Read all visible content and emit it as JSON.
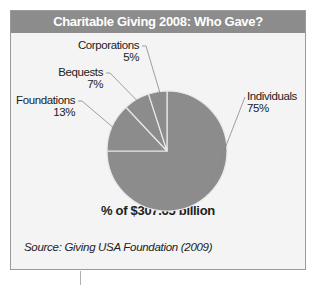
{
  "chart_data": {
    "type": "pie",
    "title": "Charitable Giving 2008: Who Gave?",
    "caption": "% of $307.65 billion",
    "source": "Source: Giving USA Foundation (2009)",
    "slices": [
      {
        "label": "Individuals",
        "value": 75,
        "value_label": "75%"
      },
      {
        "label": "Foundations",
        "value": 13,
        "value_label": "13%"
      },
      {
        "label": "Bequests",
        "value": 7,
        "value_label": "7%"
      },
      {
        "label": "Corporations",
        "value": 5,
        "value_label": "5%"
      }
    ],
    "colors": {
      "slice": "#8c8c8c",
      "separator": "#e8e8e8",
      "header": "#8c8c8c",
      "leader": "#888888"
    }
  }
}
